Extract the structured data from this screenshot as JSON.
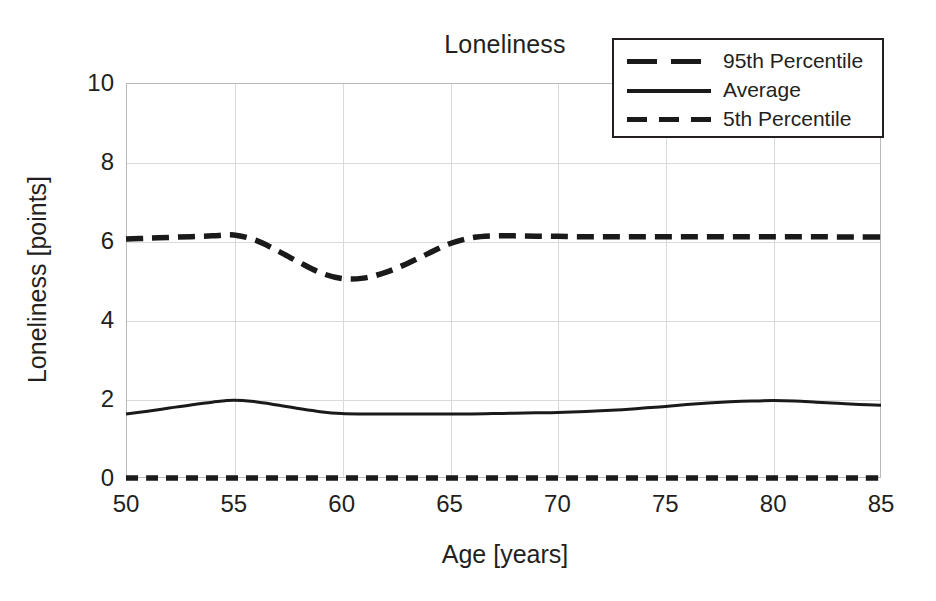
{
  "chart_data": {
    "type": "line",
    "title": "Loneliness",
    "xlabel": "Age [years]",
    "ylabel": "Loneliness [points]",
    "xlim": [
      50,
      85
    ],
    "ylim": [
      0,
      10
    ],
    "xticks": [
      50,
      55,
      60,
      65,
      70,
      75,
      80,
      85
    ],
    "yticks": [
      0,
      2,
      4,
      6,
      8,
      10
    ],
    "grid": true,
    "legend_position": "top-right",
    "x": [
      50,
      51,
      52,
      53,
      54,
      55,
      56,
      57,
      58,
      59,
      60,
      61,
      62,
      63,
      64,
      65,
      66,
      67,
      68,
      69,
      70,
      71,
      72,
      73,
      74,
      75,
      76,
      77,
      78,
      79,
      80,
      81,
      82,
      83,
      84,
      85
    ],
    "series": [
      {
        "name": "95th Percentile",
        "style": "dashed-long",
        "color": "#1a1a1a",
        "values": [
          6.05,
          6.07,
          6.09,
          6.11,
          6.13,
          6.15,
          6.02,
          5.76,
          5.47,
          5.2,
          5.05,
          5.06,
          5.2,
          5.42,
          5.68,
          5.93,
          6.08,
          6.13,
          6.13,
          6.12,
          6.12,
          6.11,
          6.11,
          6.11,
          6.11,
          6.11,
          6.11,
          6.11,
          6.11,
          6.11,
          6.11,
          6.11,
          6.11,
          6.1,
          6.1,
          6.1
        ]
      },
      {
        "name": "Average",
        "style": "solid",
        "color": "#1a1a1a",
        "values": [
          1.62,
          1.69,
          1.77,
          1.85,
          1.92,
          1.97,
          1.93,
          1.85,
          1.76,
          1.68,
          1.63,
          1.62,
          1.62,
          1.62,
          1.62,
          1.62,
          1.62,
          1.63,
          1.64,
          1.65,
          1.66,
          1.68,
          1.7,
          1.73,
          1.77,
          1.81,
          1.86,
          1.9,
          1.93,
          1.95,
          1.96,
          1.95,
          1.92,
          1.89,
          1.86,
          1.84
        ]
      },
      {
        "name": "5th Percentile",
        "style": "dashed-short",
        "color": "#1a1a1a",
        "values": [
          0,
          0,
          0,
          0,
          0,
          0,
          0,
          0,
          0,
          0,
          0,
          0,
          0,
          0,
          0,
          0,
          0,
          0,
          0,
          0,
          0,
          0,
          0,
          0,
          0,
          0,
          0,
          0,
          0,
          0,
          0,
          0,
          0,
          0,
          0,
          0
        ]
      }
    ]
  },
  "legend": {
    "items": [
      {
        "label": "95th Percentile",
        "style": "dashed-long"
      },
      {
        "label": "Average",
        "style": "solid"
      },
      {
        "label": "5th Percentile",
        "style": "dashed-short"
      }
    ]
  },
  "colors": {
    "line": "#1a1a1a",
    "grid": "#d9dadb",
    "frame": "#b9babc",
    "text": "#231f20",
    "background": "#ffffff"
  }
}
